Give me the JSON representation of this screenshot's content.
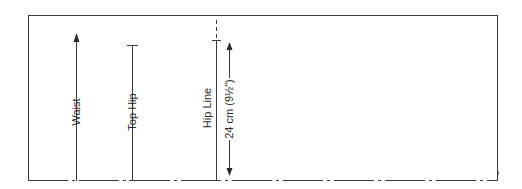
{
  "diagram": {
    "type": "pattern-block",
    "frame": {
      "left": 28,
      "top": 15,
      "right": 498,
      "bottom": 181,
      "bottom_edge_style": "dash-dot"
    },
    "lines": [
      {
        "id": "waist",
        "label": "Waist",
        "x": 76,
        "top": 35,
        "bottom": 181,
        "top_marker": "arrow"
      },
      {
        "id": "top-hip",
        "label": "Top Hip",
        "x": 132,
        "top": 45,
        "bottom": 181,
        "top_marker": "tick"
      },
      {
        "id": "hip-line",
        "label": "Hip Line",
        "x": 216,
        "top": 40,
        "bottom": 181,
        "top_marker": "tick",
        "extension_above": "dashed"
      }
    ],
    "dimension": {
      "label": "24 cm (9½\")",
      "x": 229,
      "top": 42,
      "bottom": 176,
      "ends": "double-arrow"
    },
    "colors": {
      "line": "#3a3a3a",
      "text": "#2a2a2a",
      "background": "#ffffff"
    }
  }
}
